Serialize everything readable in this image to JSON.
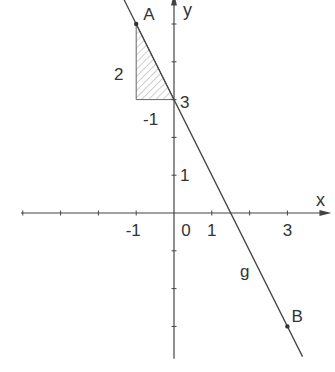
{
  "diagram": {
    "type": "coordinate-plane",
    "axes": {
      "x_label": "x",
      "y_label": "y",
      "x_ticks": [
        -4,
        -3,
        -2,
        -1,
        0,
        1,
        2,
        3
      ],
      "y_ticks": [
        -3,
        -2,
        -1,
        0,
        1,
        2,
        3,
        4,
        5
      ],
      "x_tick_labels": [
        {
          "value": -1,
          "text": "-1"
        },
        {
          "value": 0,
          "text": "0"
        },
        {
          "value": 1,
          "text": "1"
        },
        {
          "value": 3,
          "text": "3"
        }
      ],
      "y_tick_labels": [
        {
          "value": 1,
          "text": "1"
        },
        {
          "value": 3,
          "text": "3"
        }
      ],
      "x_range": [
        -4.1,
        3.9
      ],
      "y_range": [
        -3.8,
        5.7
      ]
    },
    "line": {
      "name": "g",
      "slope": -2,
      "intercept": 3,
      "color": "#444444"
    },
    "points": [
      {
        "name": "A",
        "x": -1,
        "y": 5
      },
      {
        "name": "B",
        "x": 3,
        "y": -3
      }
    ],
    "slope_triangle": {
      "vertices": [
        [
          -1,
          5
        ],
        [
          -1,
          3
        ],
        [
          0,
          3
        ]
      ],
      "vertical_label": "2",
      "horizontal_label": "-1",
      "hatch_color": "#888888"
    }
  }
}
